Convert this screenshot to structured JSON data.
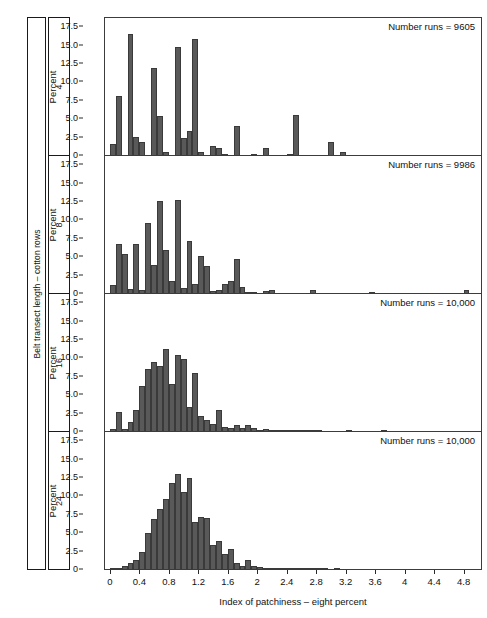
{
  "strips": {
    "outer_label": "Belt transect length – cotton rows",
    "panels": [
      "4",
      "8",
      "16",
      "24"
    ]
  },
  "axes": {
    "ylabel": "Percent",
    "yticks": [
      "0",
      "2.5",
      "5.0",
      "7.5",
      "10.0",
      "12.5",
      "15.0",
      "17.5"
    ],
    "xlabel": "Index of patchiness – eight percent",
    "xticks": [
      "0",
      "0.4",
      "0.8",
      "1.2",
      "1.6",
      "2",
      "2.4",
      "2.8",
      "3.2",
      "3.6",
      "4",
      "4.4",
      "4.8"
    ]
  },
  "chart_data": {
    "type": "bar",
    "title": "",
    "xlabel": "Index of patchiness – eight percent",
    "ylabel": "Percent",
    "xlim": [
      -0.08,
      5.05
    ],
    "ylim": [
      0,
      18.6
    ],
    "grid": false,
    "legend": "none",
    "layout": "4 vertically stacked histogram panels sharing one x-axis",
    "panel_variable": "Belt transect length – cotton rows",
    "panels": [
      {
        "panel_label": "4",
        "annotation": "Number runs = 9605",
        "bin_width": 0.08,
        "x": [
          0.04,
          0.12,
          0.2,
          0.28,
          0.36,
          0.44,
          0.52,
          0.6,
          0.68,
          0.76,
          0.84,
          0.92,
          1.0,
          1.08,
          1.16,
          1.24,
          1.32,
          1.4,
          1.48,
          1.56,
          1.64,
          1.72,
          1.8,
          1.88,
          1.96,
          2.04,
          2.12,
          2.2,
          2.28,
          2.36,
          2.44,
          2.52,
          2.6,
          2.68,
          2.76,
          2.84,
          2.92,
          3.0,
          3.08,
          3.16,
          3.24,
          3.32,
          3.4,
          3.48,
          3.56,
          3.64,
          3.72,
          3.8,
          3.88,
          3.96,
          4.04
        ],
        "values": [
          1.6,
          8.2,
          0.0,
          16.5,
          2.6,
          1.9,
          0.0,
          12.0,
          5.5,
          0.6,
          0.0,
          14.8,
          2.5,
          3.4,
          15.9,
          0.6,
          0.0,
          1.4,
          1.1,
          0.15,
          0.0,
          4.1,
          0.0,
          0.0,
          0.2,
          0.0,
          1.1,
          0.0,
          0.0,
          0.0,
          0.3,
          5.6,
          0.0,
          0.0,
          0.0,
          0.0,
          0.0,
          1.9,
          0.0,
          0.5,
          0.0,
          0.0,
          0.0,
          0.0,
          0.0,
          0.0,
          0.0,
          0.0,
          0.0,
          0.0,
          0.0
        ]
      },
      {
        "panel_label": "8",
        "annotation": "Number runs = 9986",
        "bin_width": 0.08,
        "x": [
          0.04,
          0.12,
          0.2,
          0.28,
          0.36,
          0.44,
          0.52,
          0.6,
          0.68,
          0.76,
          0.84,
          0.92,
          1.0,
          1.08,
          1.16,
          1.24,
          1.32,
          1.4,
          1.48,
          1.56,
          1.64,
          1.72,
          1.8,
          1.88,
          1.96,
          2.04,
          2.12,
          2.2,
          2.28,
          2.36,
          2.44,
          2.52,
          2.6,
          2.68,
          2.76,
          2.84,
          2.92,
          3.0,
          3.08,
          3.16,
          3.24,
          3.32,
          3.4,
          3.48,
          3.56,
          3.64,
          3.72,
          3.8,
          3.88,
          3.96,
          4.04,
          4.12,
          4.2,
          4.28,
          4.36,
          4.44,
          4.52,
          4.6,
          4.68,
          4.76,
          4.84
        ],
        "values": [
          1.2,
          6.8,
          5.4,
          0.7,
          6.8,
          0.6,
          9.6,
          3.9,
          12.6,
          6.0,
          1.7,
          12.7,
          0.8,
          7.2,
          1.3,
          5.1,
          3.8,
          0.4,
          0.5,
          1.4,
          1.8,
          4.7,
          0.9,
          0.3,
          0.2,
          0.0,
          0.4,
          0.5,
          0.0,
          0.0,
          0.0,
          0.0,
          0.0,
          0.0,
          0.6,
          0.0,
          0.0,
          0.0,
          0.0,
          0.0,
          0.0,
          0.0,
          0.0,
          0.0,
          0.2,
          0.0,
          0.0,
          0.0,
          0.0,
          0.0,
          0.0,
          0.0,
          0.0,
          0.0,
          0.0,
          0.0,
          0.0,
          0.0,
          0.0,
          0.0,
          0.6
        ]
      },
      {
        "panel_label": "16",
        "annotation": "Number runs = 10,000",
        "bin_width": 0.08,
        "x": [
          0.04,
          0.12,
          0.2,
          0.28,
          0.36,
          0.44,
          0.52,
          0.6,
          0.68,
          0.76,
          0.84,
          0.92,
          1.0,
          1.08,
          1.16,
          1.24,
          1.32,
          1.4,
          1.48,
          1.56,
          1.64,
          1.72,
          1.8,
          1.88,
          1.96,
          2.04,
          2.12,
          2.2,
          2.28,
          2.36,
          2.44,
          2.52,
          2.6,
          2.68,
          2.76,
          2.84,
          2.92,
          3.0,
          3.08,
          3.16,
          3.24,
          3.32,
          3.4,
          3.48,
          3.56,
          3.64,
          3.72,
          3.8,
          3.88,
          3.96,
          4.04,
          4.12,
          4.2,
          4.28,
          4.36,
          4.44,
          4.52,
          4.6,
          4.68,
          4.76,
          4.84
        ],
        "values": [
          0.4,
          2.7,
          0.4,
          1.3,
          3.0,
          6.3,
          8.6,
          9.5,
          8.9,
          11.3,
          6.5,
          10.4,
          9.9,
          3.4,
          8.0,
          2.2,
          1.6,
          1.1,
          3.0,
          0.7,
          0.6,
          0.9,
          0.5,
          0.9,
          0.5,
          0.3,
          0.35,
          0.1,
          0.25,
          0.05,
          0.15,
          0.1,
          0.1,
          0.05,
          0.05,
          0.05,
          0.0,
          0.0,
          0.0,
          0.0,
          0.05,
          0.0,
          0.0,
          0.0,
          0.0,
          0.0,
          0.05,
          0.0,
          0.0,
          0.0,
          0.0,
          0.0,
          0.0,
          0.0,
          0.0,
          0.0,
          0.0,
          0.0,
          0.0,
          0.0,
          0.0
        ]
      },
      {
        "panel_label": "24",
        "annotation": "Number runs = 10,000",
        "bin_width": 0.08,
        "x": [
          0.04,
          0.12,
          0.2,
          0.28,
          0.36,
          0.44,
          0.52,
          0.6,
          0.68,
          0.76,
          0.84,
          0.92,
          1.0,
          1.08,
          1.16,
          1.24,
          1.32,
          1.4,
          1.48,
          1.56,
          1.64,
          1.72,
          1.8,
          1.88,
          1.96,
          2.04,
          2.12,
          2.2,
          2.28,
          2.36,
          2.44,
          2.52,
          2.6,
          2.68,
          2.76,
          2.84,
          2.92,
          3.0,
          3.08,
          3.16,
          3.24,
          3.32,
          3.4,
          3.48,
          3.56,
          3.64,
          3.72,
          3.8,
          3.88,
          3.96,
          4.04
        ],
        "values": [
          0.1,
          0.3,
          0.5,
          0.9,
          1.4,
          2.4,
          5.0,
          6.9,
          8.3,
          9.7,
          11.8,
          13.1,
          10.6,
          12.5,
          6.5,
          7.2,
          7.0,
          3.4,
          3.9,
          2.2,
          2.9,
          1.0,
          0.6,
          1.3,
          0.5,
          0.35,
          0.3,
          0.2,
          0.25,
          0.1,
          0.1,
          0.05,
          0.1,
          0.05,
          0.05,
          0.1,
          0.05,
          0.0,
          0.05,
          0.0,
          0.0,
          0.0,
          0.0,
          0.0,
          0.0,
          0.0,
          0.0,
          0.0,
          0.0,
          0.0,
          0.0
        ]
      }
    ]
  },
  "colors": {
    "bar_fill": "#595959",
    "bar_edge": "#3a3a3a",
    "frame": "#3c3c3c",
    "text": "#111111"
  }
}
